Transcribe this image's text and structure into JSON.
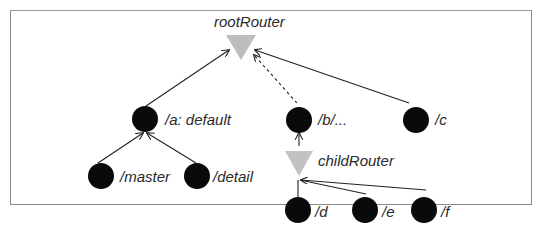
{
  "diagram": {
    "routers": [
      {
        "id": "root",
        "label": "rootRouter",
        "color": "#bdbdbd"
      },
      {
        "id": "child",
        "label": "childRouter",
        "color": "#bdbdbd"
      }
    ],
    "routes": [
      {
        "id": "a",
        "label": "/a: default",
        "parent": "root",
        "edge": "solid"
      },
      {
        "id": "b",
        "label": "/b/...",
        "parent": "root",
        "edge": "dashed"
      },
      {
        "id": "c",
        "label": "/c",
        "parent": "root",
        "edge": "solid"
      },
      {
        "id": "master",
        "label": "/master",
        "parent": "a",
        "edge": "solid"
      },
      {
        "id": "detail",
        "label": "/detail",
        "parent": "a",
        "edge": "solid"
      },
      {
        "id": "d",
        "label": "/d",
        "parent": "child",
        "edge": "solid"
      },
      {
        "id": "e",
        "label": "/e",
        "parent": "child",
        "edge": "solid"
      },
      {
        "id": "f",
        "label": "/f",
        "parent": "child",
        "edge": "solid"
      }
    ],
    "extra_edges": [
      {
        "from": "child",
        "to": "b",
        "edge": "solid"
      }
    ],
    "colors": {
      "node": "#0a0a0a",
      "router": "#bdbdbd",
      "edge": "#222222",
      "frame": "#8a8a8a"
    }
  }
}
